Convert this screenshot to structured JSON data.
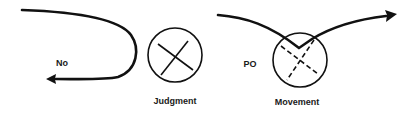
{
  "diagram": {
    "stroke_color": "#111111",
    "background": "#ffffff",
    "panels": [
      {
        "id": "no",
        "label": "No",
        "description": "Curved path that turns back on itself with arrow pointing left"
      },
      {
        "id": "judgment",
        "label": "Judgment",
        "description": "Circle with a solid X inside"
      },
      {
        "id": "movement",
        "label": "Movement",
        "side_label": "PO",
        "description": "Path dips into a circle with a dashed X and continues onward with arrow pointing right"
      }
    ]
  }
}
